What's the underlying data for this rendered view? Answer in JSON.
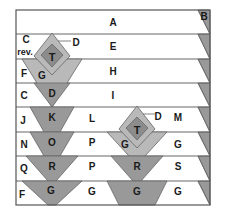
{
  "colors": {
    "frame": "#555555",
    "row_line": "#666666",
    "dark_gray": "#999999",
    "mid_gray": "#8c8c8c",
    "light_gray": "#b9b9b9",
    "white": "#ffffff"
  },
  "corner_label": "B",
  "rows": [
    {
      "left": "",
      "center": "A",
      "right": ""
    },
    {
      "left": "C",
      "left2": "rev.",
      "center": "E",
      "right": ""
    },
    {
      "left": "F",
      "center": "H",
      "right": ""
    },
    {
      "left": "C",
      "center": "I",
      "right": ""
    },
    {
      "left": "J",
      "center": "L",
      "right": "M"
    },
    {
      "left": "N",
      "center": "P",
      "right": "G"
    },
    {
      "left": "Q",
      "center": "P",
      "right": "S"
    },
    {
      "left": "F",
      "center": "G",
      "right": "G"
    }
  ],
  "shapes": {
    "col1": {
      "diamond_outer_label": "G",
      "diamond_inner_label": "T",
      "pointer_label": "D",
      "triangles": [
        "D",
        "K",
        "O",
        "R",
        "G"
      ]
    },
    "col2": {
      "diamond_outer_label": "G",
      "diamond_inner_label": "T",
      "pointer_label": "D",
      "triangles": [
        "R",
        "G"
      ]
    }
  }
}
